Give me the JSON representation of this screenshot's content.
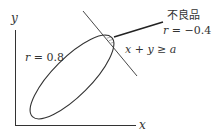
{
  "diagram": {
    "axes": {
      "x_label": "x",
      "y_label": "y"
    },
    "ellipse": {
      "correlation_label": "r = 0.8"
    },
    "boundary_line": {
      "condition_label": "x + y ≥ a"
    },
    "defect_region": {
      "title": "不良品",
      "correlation_label": "r = −0.4"
    },
    "colors": {
      "stroke": "#333333",
      "hatch": "#333333",
      "background": "#ffffff"
    }
  }
}
